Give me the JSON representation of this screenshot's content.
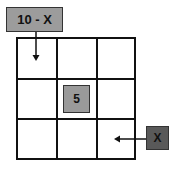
{
  "diagram": {
    "grid": {
      "rows": 3,
      "cols": 3
    },
    "labels": {
      "top_input": "10 - X",
      "center": "5",
      "right_input": "X"
    },
    "arrows": [
      {
        "from": "top_input",
        "to": "cell-0-0",
        "direction": "down"
      },
      {
        "from": "right_input",
        "to": "cell-2-2",
        "direction": "left"
      }
    ],
    "colors": {
      "light_box": "#9c9c9c",
      "dark_box": "#595959",
      "lines": "#111111"
    }
  }
}
